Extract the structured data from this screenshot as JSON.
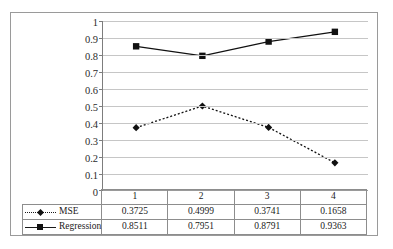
{
  "chart_data": {
    "type": "line",
    "title": "",
    "xlabel": "",
    "ylabel": "",
    "categories": [
      "1",
      "2",
      "3",
      "4"
    ],
    "ylim": [
      0,
      1
    ],
    "yticks": [
      "0",
      "0.1",
      "0.2",
      "0.3",
      "0.4",
      "0.5",
      "0.6",
      "0.7",
      "0.8",
      "0.9",
      "1"
    ],
    "grid": true,
    "legend_position": "data-table-left",
    "series": [
      {
        "name": "MSE",
        "values": [
          0.3725,
          0.4999,
          0.3741,
          0.1658
        ],
        "labels": [
          "0.3725",
          "0.4999",
          "0.3741",
          "0.1658"
        ],
        "line_style": "dotted",
        "marker": "diamond",
        "color": "#111111"
      },
      {
        "name": "Regression",
        "values": [
          0.8511,
          0.7951,
          0.8791,
          0.9363
        ],
        "labels": [
          "0.8511",
          "0.7951",
          "0.8791",
          "0.9363"
        ],
        "line_style": "solid",
        "marker": "square",
        "color": "#111111"
      }
    ]
  },
  "table": {
    "header": [
      "1",
      "2",
      "3",
      "4"
    ],
    "rows": [
      {
        "label": "MSE",
        "cells": [
          "0.3725",
          "0.4999",
          "0.3741",
          "0.1658"
        ]
      },
      {
        "label": "Regression",
        "cells": [
          "0.8511",
          "0.7951",
          "0.8791",
          "0.9363"
        ]
      }
    ]
  },
  "colors": {
    "series": "#111111",
    "gridline": "#c6c6c6",
    "axis": "#7d7d7d",
    "frame": "#9a9a9a",
    "background": "#ffffff"
  }
}
